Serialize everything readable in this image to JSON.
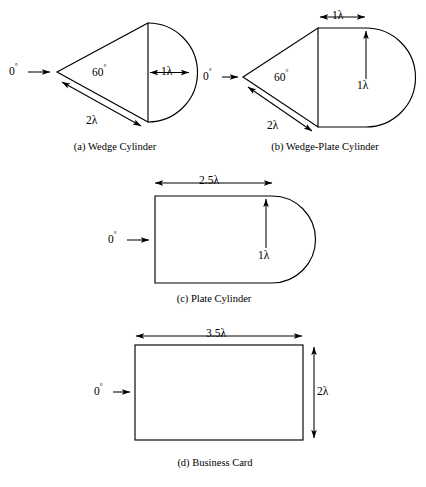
{
  "figure": {
    "background_color": "#ffffff",
    "line_color": "#000000",
    "wavelength_symbol": "λ",
    "degree_symbol": "°"
  },
  "panels": [
    {
      "id": "wedge-cylinder",
      "key": "a",
      "caption": "(a)  Wedge Cylinder",
      "incidence_label": "0",
      "incidence_degree": "°",
      "angle_label": "60",
      "angle_degree": "°",
      "dimensions": [
        {
          "name": "slant-length",
          "value": "2λ"
        },
        {
          "name": "cylinder-diameter",
          "value": "1λ"
        }
      ]
    },
    {
      "id": "wedge-plate-cylinder",
      "key": "b",
      "caption": "(b)  Wedge-Plate Cylinder",
      "incidence_label": "0",
      "incidence_degree": "°",
      "angle_label": "60",
      "angle_degree": "°",
      "dimensions": [
        {
          "name": "slant-length",
          "value": "2λ"
        },
        {
          "name": "plate-length",
          "value": "1λ"
        },
        {
          "name": "plate-half-height",
          "value": "1λ"
        }
      ]
    },
    {
      "id": "plate-cylinder",
      "key": "c",
      "caption": "(c)  Plate Cylinder",
      "incidence_label": "0",
      "incidence_degree": "°",
      "dimensions": [
        {
          "name": "plate-length",
          "value": "2.5λ"
        },
        {
          "name": "plate-half-height",
          "value": "1λ"
        }
      ]
    },
    {
      "id": "business-card",
      "key": "d",
      "caption": "(d)  Business Card",
      "incidence_label": "0",
      "incidence_degree": "°",
      "dimensions": [
        {
          "name": "card-width",
          "value": "3.5λ"
        },
        {
          "name": "card-height",
          "value": "2λ"
        }
      ]
    }
  ],
  "labels": {
    "a_incidence": "0",
    "a_angle": "60",
    "a_slant": "2λ",
    "a_diameter": "1λ",
    "a_caption": "(a)  Wedge Cylinder",
    "b_incidence": "0",
    "b_angle": "60",
    "b_slant": "2λ",
    "b_plate_len": "1λ",
    "b_plate_h": "1λ",
    "b_caption": "(b)  Wedge-Plate Cylinder",
    "c_incidence": "0",
    "c_plate_len": "2.5λ",
    "c_plate_h": "1λ",
    "c_caption": "(c)  Plate Cylinder",
    "d_incidence": "0",
    "d_width": "3.5λ",
    "d_height": "2λ",
    "d_caption": "(d)  Business Card",
    "degree": "°"
  }
}
